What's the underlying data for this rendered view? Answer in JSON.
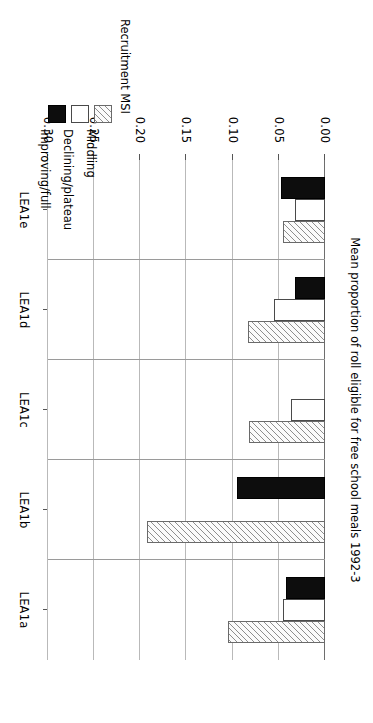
{
  "chart_data": {
    "type": "bar",
    "orientation": "horizontal",
    "title": "",
    "xlabel": "",
    "ylabel": "Mean proportion of roll eligible for free school meals 1992-3",
    "categories": [
      "LEA1a",
      "LEA1b",
      "LEA1c",
      "LEA1d",
      "LEA1e"
    ],
    "ylim": [
      0.0,
      0.3
    ],
    "tick_labels": [
      "0.00",
      "0.05",
      "0.10",
      "0.15",
      "0.20",
      "0.25",
      "0.30"
    ],
    "tick_values": [
      0.0,
      0.05,
      0.1,
      0.15,
      0.2,
      0.25,
      0.3
    ],
    "grid": true,
    "legend_position": "right",
    "legend_title": "Recruitment MSI",
    "series": [
      {
        "name": "Middling",
        "key": "middling",
        "pattern": "hatched",
        "color": "#fbfbfb",
        "values": [
          0.105,
          0.193,
          0.082,
          0.083,
          0.046
        ]
      },
      {
        "name": "Declining/plateau",
        "key": "declining",
        "pattern": "solid",
        "color": "#ffffff",
        "values": [
          0.045,
          0.0,
          0.037,
          0.055,
          0.032
        ]
      },
      {
        "name": "Improving/full",
        "key": "improving",
        "pattern": "filled",
        "color": "#0d0d0d",
        "values": [
          0.042,
          0.095,
          0.0,
          0.033,
          0.048
        ]
      }
    ]
  },
  "axis": {
    "value_label": "Mean proportion of roll eligible for free school meals 1992-3",
    "ticks": [
      "0.00",
      "0.05",
      "0.10",
      "0.15",
      "0.20",
      "0.25",
      "0.30"
    ],
    "categories": [
      "LEA1a",
      "LEA1b",
      "LEA1c",
      "LEA1d",
      "LEA1e"
    ]
  },
  "legend": {
    "title": "Recruitment MSI",
    "items": [
      {
        "label": "Middling",
        "swatch": "hatched-swatch"
      },
      {
        "label": "Declining/plateau",
        "swatch": "white-swatch"
      },
      {
        "label": "Improving/full",
        "swatch": "black-swatch"
      }
    ]
  }
}
